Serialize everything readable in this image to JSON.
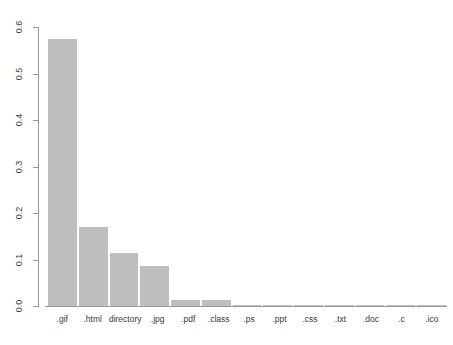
{
  "chart": {
    "type": "bar",
    "title": "",
    "xlabel": "",
    "ylabel": "",
    "bar_color": "#bebebe",
    "axis_color": "#9a9a9a",
    "text_color": "#3a3a3a",
    "grid": false,
    "legend": false
  },
  "chart_data": {
    "type": "bar",
    "title": "",
    "subtitle": "",
    "xlabel": "",
    "ylabel": "",
    "ylim": [
      0,
      0.6
    ],
    "yticks": [
      0,
      0.1,
      0.2,
      0.3,
      0.4,
      0.5,
      0.6
    ],
    "ytick_labels": [
      "0.0",
      "0.1",
      "0.2",
      "0.3",
      "0.4",
      "0.5",
      "0.6"
    ],
    "grid": false,
    "legend": null,
    "categories": [
      ".gif",
      ".html",
      "directory",
      ".jpg",
      ".pdf",
      ".class",
      ".ps",
      ".ppt",
      ".css",
      ".txt",
      ".doc",
      ".c",
      ".ico"
    ],
    "values": [
      0.575,
      0.169,
      0.115,
      0.086,
      0.013,
      0.012,
      0.003,
      0.002,
      0.002,
      0.002,
      0.002,
      0.001,
      0.001
    ],
    "series": [
      {
        "name": "proportion",
        "values": [
          0.575,
          0.169,
          0.115,
          0.086,
          0.013,
          0.012,
          0.003,
          0.002,
          0.002,
          0.002,
          0.002,
          0.001,
          0.001
        ]
      }
    ]
  },
  "y_axis": {
    "ticks": [
      {
        "label": "0.6",
        "value": 0.6
      },
      {
        "label": "0.5",
        "value": 0.5
      },
      {
        "label": "0.4",
        "value": 0.4
      },
      {
        "label": "0.3",
        "value": 0.3
      },
      {
        "label": "0.2",
        "value": 0.2
      },
      {
        "label": "0.1",
        "value": 0.1
      },
      {
        "label": "0.0",
        "value": 0.0
      }
    ]
  }
}
